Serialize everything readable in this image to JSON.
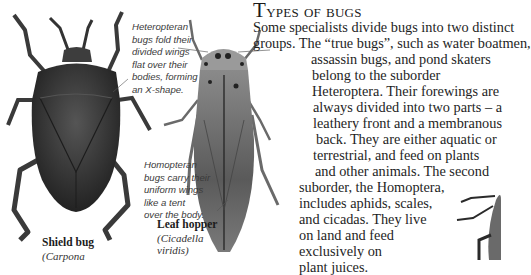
{
  "heading": {
    "first_letter": "T",
    "rest": "ypes of bugs"
  },
  "body_lines": [
    "Some specialists divide bugs into two distinct",
    "groups. The “true bugs”, such as water boatmen,",
    "assassin bugs, and pond skaters",
    "belong to the suborder",
    "Heteroptera. Their forewings are",
    "always divided into two parts – a",
    "leathery front and a membranous",
    "back. They are either aquatic or",
    "terrestrial, and feed on plants",
    "and other animals. The second",
    "suborder, the Homoptera,",
    "includes aphids, scales,",
    "and cicadas. They live",
    "on land and feed",
    "exclusively on",
    "plant juices."
  ],
  "captions": {
    "heteropteran": [
      "Heteropteran",
      "bugs fold their",
      "divided wings",
      "flat over their",
      "bodies, forming",
      "an X-shape."
    ],
    "homopteran": [
      "Homopteran",
      "bugs carry their",
      "uniform wings",
      "like a tent",
      "over the body."
    ]
  },
  "specimens": {
    "shield_bug": {
      "name": "Shield bug",
      "scientific": "(Carpona"
    },
    "leaf_hopper": {
      "name": "Leaf hopper",
      "scientific_1": "(Cicadella",
      "scientific_2": "viridis)"
    }
  },
  "colors": {
    "shield_bug_body": "#3a3a3a",
    "leaf_hopper_body": "#6a6a6a",
    "text": "#1e1e1e",
    "caption": "#3a3a3a"
  }
}
